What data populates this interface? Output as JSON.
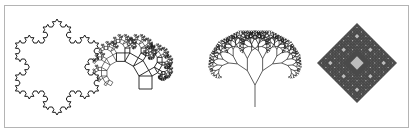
{
  "figure": {
    "background": "#ffffff",
    "border_color": "#b4b4b4",
    "stroke_color": "#1a1a1a",
    "fractals": [
      {
        "name": "koch-snowflake",
        "type": "koch",
        "center": [
          57,
          67
        ],
        "radius": 48,
        "depth": 3
      },
      {
        "name": "pythagoras-tree",
        "type": "pythagoras",
        "base": [
          139,
          89
        ],
        "size": 13,
        "angle_deg": 30,
        "depth": 8
      },
      {
        "name": "fractal-binary-tree",
        "type": "binary-tree",
        "root": [
          255,
          107
        ],
        "trunk_length": 22,
        "spread_deg": 28,
        "ratio": 0.74,
        "depth": 9
      },
      {
        "name": "diamond-carpet",
        "type": "diamond",
        "center": [
          357,
          63
        ],
        "half_diagonal": 40,
        "depth": 4,
        "fill": "#4a4a4a",
        "hole": "#bdbdbd"
      }
    ]
  }
}
